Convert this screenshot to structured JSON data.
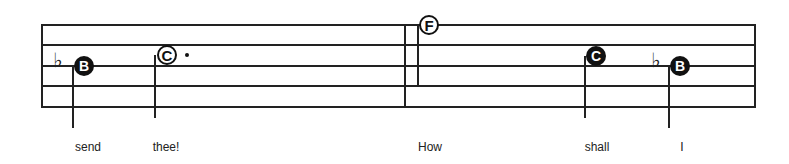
{
  "staff": {
    "lines": 5,
    "color": "#222222"
  },
  "notes": [
    {
      "id": "note-1",
      "letter": "B",
      "style": "filled",
      "accidental": "♭",
      "lyric": "send"
    },
    {
      "id": "note-2",
      "letter": "C",
      "style": "open",
      "dotted": true,
      "lyric": "thee!"
    },
    {
      "id": "note-3",
      "letter": "F",
      "style": "open",
      "lyric": "How"
    },
    {
      "id": "note-4",
      "letter": "C",
      "style": "filled",
      "lyric": "shall"
    },
    {
      "id": "note-5",
      "letter": "B",
      "style": "filled",
      "accidental": "♭",
      "lyric": "I"
    }
  ]
}
